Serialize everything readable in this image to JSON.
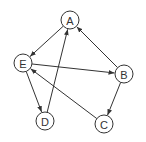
{
  "diagram": {
    "type": "directed-graph",
    "nodes": [
      {
        "id": "A",
        "label": "A"
      },
      {
        "id": "B",
        "label": "B"
      },
      {
        "id": "C",
        "label": "C"
      },
      {
        "id": "D",
        "label": "D"
      },
      {
        "id": "E",
        "label": "E"
      }
    ],
    "edges": [
      {
        "from": "A",
        "to": "E"
      },
      {
        "from": "D",
        "to": "A"
      },
      {
        "from": "B",
        "to": "A"
      },
      {
        "from": "E",
        "to": "B"
      },
      {
        "from": "E",
        "to": "D"
      },
      {
        "from": "B",
        "to": "C"
      },
      {
        "from": "C",
        "to": "E"
      }
    ],
    "colors": {
      "stroke": "#333333",
      "fill": "#ffffff"
    }
  }
}
